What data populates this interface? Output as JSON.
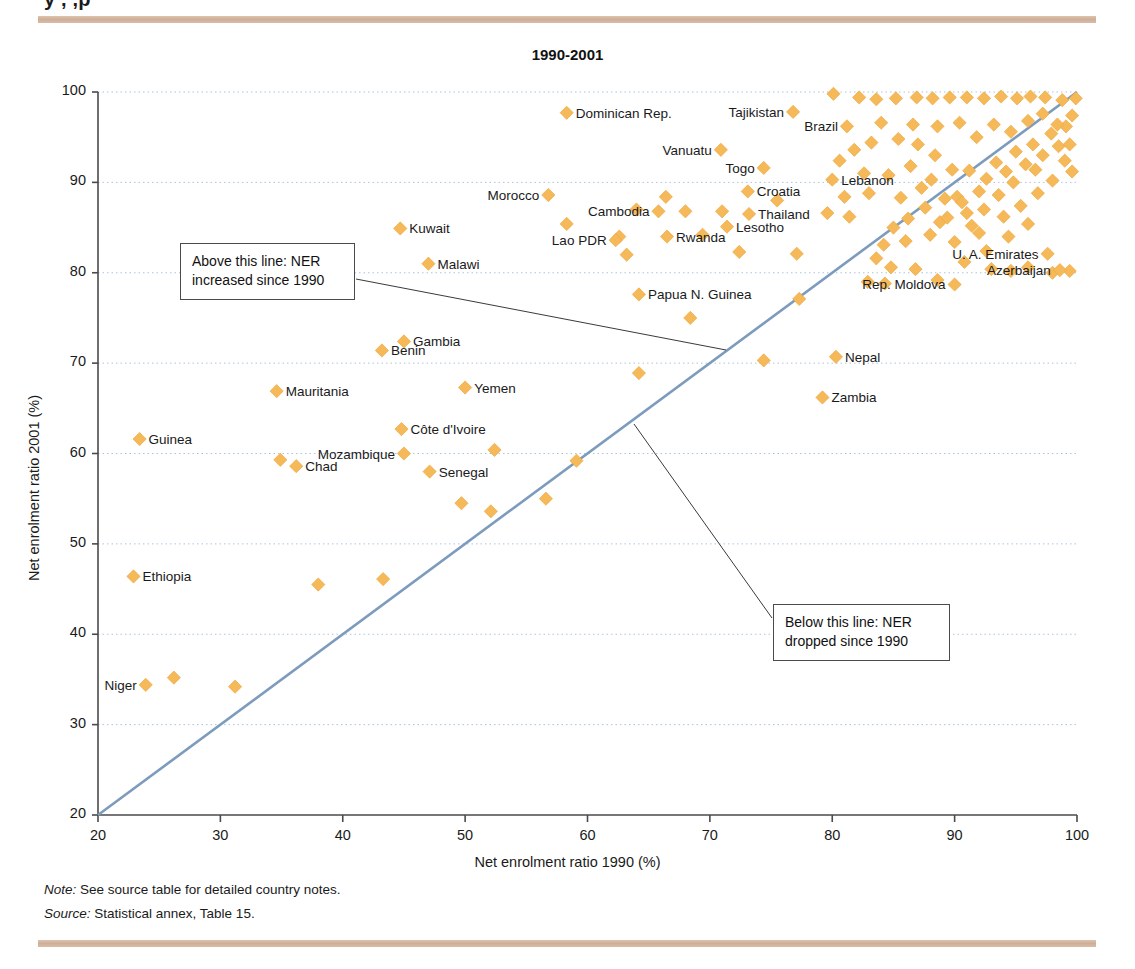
{
  "page": {
    "clipped_heading": "y             ,    ,p",
    "note": {
      "lead": "Note:",
      "text": " See source table for detailed country notes."
    },
    "source": {
      "lead": "Source:",
      "text": " Statistical annex, Table 15."
    },
    "colors": {
      "marker": "#F5B95A",
      "marker_stroke": "#EEA93F",
      "diagonal": "#7C9BBD",
      "grid": "#A9C6E0",
      "axis": "#4a4a4a",
      "rule_bar": "#d3b39c"
    }
  },
  "annotations": [
    {
      "id": "above",
      "line1": "Above this line: NER",
      "line2": "increased since 1990"
    },
    {
      "id": "below",
      "line1": "Below this line: NER",
      "line2": "dropped since 1990"
    }
  ],
  "chart_data": {
    "type": "scatter",
    "title": "1990-2001",
    "xlabel": "Net enrolment ratio 1990 (%)",
    "ylabel": "Net enrolment ratio 2001 (%)",
    "xlim": [
      20,
      100
    ],
    "ylim": [
      20,
      100
    ],
    "xticks": [
      20,
      30,
      40,
      50,
      60,
      70,
      80,
      90,
      100
    ],
    "yticks": [
      20,
      30,
      40,
      50,
      60,
      70,
      80,
      90,
      100
    ],
    "grid": "horizontal-dotted",
    "legend": "none",
    "reference_line": {
      "name": "y = x (no change since 1990)",
      "from": [
        20,
        20
      ],
      "to": [
        100,
        100
      ]
    },
    "labeled_points": [
      {
        "label": "Dominican Rep.",
        "x": 58.3,
        "y": 97.7,
        "side": "right"
      },
      {
        "label": "Tajikistan",
        "x": 76.8,
        "y": 97.8,
        "side": "left"
      },
      {
        "label": "Brazil",
        "x": 81.2,
        "y": 96.2,
        "side": "left"
      },
      {
        "label": "Vanuatu",
        "x": 70.9,
        "y": 93.6,
        "side": "left"
      },
      {
        "label": "Togo",
        "x": 74.4,
        "y": 91.6,
        "side": "left"
      },
      {
        "label": "Lebanon",
        "x": 80.0,
        "y": 90.3,
        "side": "right"
      },
      {
        "label": "Croatia",
        "x": 73.1,
        "y": 89.0,
        "side": "right"
      },
      {
        "label": "Morocco",
        "x": 56.8,
        "y": 88.6,
        "side": "left"
      },
      {
        "label": "Cambodia",
        "x": 65.8,
        "y": 86.8,
        "side": "left"
      },
      {
        "label": "Thailand",
        "x": 73.2,
        "y": 86.5,
        "side": "right"
      },
      {
        "label": "Kuwait",
        "x": 44.7,
        "y": 84.9,
        "side": "right"
      },
      {
        "label": "Lesotho",
        "x": 71.4,
        "y": 85.1,
        "side": "right"
      },
      {
        "label": "Rwanda",
        "x": 66.5,
        "y": 84.0,
        "side": "right"
      },
      {
        "label": "Lao PDR",
        "x": 62.3,
        "y": 83.6,
        "side": "left"
      },
      {
        "label": "Malawi",
        "x": 47.0,
        "y": 81.0,
        "side": "right"
      },
      {
        "label": "U. A. Emirates",
        "x": 97.6,
        "y": 82.1,
        "side": "left"
      },
      {
        "label": "Azerbaijan",
        "x": 98.6,
        "y": 80.3,
        "side": "left"
      },
      {
        "label": "Rep. Moldova",
        "x": 90.0,
        "y": 78.7,
        "side": "left"
      },
      {
        "label": "Papua N. Guinea",
        "x": 64.2,
        "y": 77.6,
        "side": "right"
      },
      {
        "label": "Gambia",
        "x": 45.0,
        "y": 72.4,
        "side": "right"
      },
      {
        "label": "Benin",
        "x": 43.2,
        "y": 71.4,
        "side": "right"
      },
      {
        "label": "Nepal",
        "x": 80.3,
        "y": 70.7,
        "side": "right"
      },
      {
        "label": "Yemen",
        "x": 50.0,
        "y": 67.3,
        "side": "right"
      },
      {
        "label": "Mauritania",
        "x": 34.6,
        "y": 66.9,
        "side": "right"
      },
      {
        "label": "Zambia",
        "x": 79.2,
        "y": 66.2,
        "side": "right"
      },
      {
        "label": "Côte d'Ivoire",
        "x": 44.8,
        "y": 62.7,
        "side": "right"
      },
      {
        "label": "Guinea",
        "x": 23.4,
        "y": 61.6,
        "side": "right"
      },
      {
        "label": "Mozambique",
        "x": 45.0,
        "y": 60.0,
        "side": "left"
      },
      {
        "label": "Chad",
        "x": 36.2,
        "y": 58.6,
        "side": "right"
      },
      {
        "label": "Senegal",
        "x": 47.1,
        "y": 58.0,
        "side": "right"
      },
      {
        "label": "Ethiopia",
        "x": 22.9,
        "y": 46.4,
        "side": "right"
      },
      {
        "label": "Niger",
        "x": 23.9,
        "y": 34.4,
        "side": "left"
      }
    ],
    "unlabeled_points": [
      [
        26.2,
        35.2
      ],
      [
        31.2,
        34.2
      ],
      [
        38.0,
        45.5
      ],
      [
        43.3,
        46.1
      ],
      [
        49.7,
        54.5
      ],
      [
        52.1,
        53.6
      ],
      [
        56.6,
        55.0
      ],
      [
        59.1,
        59.2
      ],
      [
        52.4,
        60.4
      ],
      [
        34.9,
        59.3
      ],
      [
        64.2,
        68.9
      ],
      [
        68.4,
        75.0
      ],
      [
        74.4,
        70.3
      ],
      [
        77.3,
        77.1
      ],
      [
        72.4,
        82.3
      ],
      [
        77.1,
        82.1
      ],
      [
        83.6,
        81.6
      ],
      [
        84.3,
        78.8
      ],
      [
        82.9,
        79.0
      ],
      [
        88.6,
        79.2
      ],
      [
        88.8,
        85.6
      ],
      [
        91.0,
        86.6
      ],
      [
        89.4,
        86.1
      ],
      [
        86.0,
        83.5
      ],
      [
        84.2,
        83.1
      ],
      [
        81.4,
        86.2
      ],
      [
        85.6,
        88.3
      ],
      [
        87.3,
        89.4
      ],
      [
        88.1,
        90.3
      ],
      [
        90.2,
        88.4
      ],
      [
        91.2,
        91.3
      ],
      [
        92.0,
        89.0
      ],
      [
        92.6,
        90.4
      ],
      [
        93.4,
        92.2
      ],
      [
        94.2,
        91.2
      ],
      [
        95.0,
        93.4
      ],
      [
        95.8,
        92.0
      ],
      [
        96.4,
        94.2
      ],
      [
        97.2,
        93.0
      ],
      [
        97.9,
        95.4
      ],
      [
        98.5,
        94.0
      ],
      [
        99.1,
        96.2
      ],
      [
        99.6,
        97.4
      ],
      [
        99.9,
        99.3
      ],
      [
        98.8,
        99.1
      ],
      [
        97.4,
        99.4
      ],
      [
        96.2,
        99.5
      ],
      [
        95.1,
        99.3
      ],
      [
        93.8,
        99.5
      ],
      [
        92.4,
        99.3
      ],
      [
        91.0,
        99.4
      ],
      [
        89.6,
        99.4
      ],
      [
        88.2,
        99.3
      ],
      [
        86.9,
        99.4
      ],
      [
        85.2,
        99.3
      ],
      [
        83.6,
        99.2
      ],
      [
        82.2,
        99.4
      ],
      [
        80.1,
        99.8
      ],
      [
        84.0,
        96.6
      ],
      [
        86.6,
        96.4
      ],
      [
        88.6,
        96.2
      ],
      [
        90.4,
        96.6
      ],
      [
        91.8,
        95.0
      ],
      [
        93.2,
        96.4
      ],
      [
        94.6,
        95.6
      ],
      [
        96.0,
        96.8
      ],
      [
        97.2,
        97.6
      ],
      [
        98.4,
        96.4
      ],
      [
        99.4,
        94.2
      ],
      [
        99.6,
        91.2
      ],
      [
        96.6,
        91.4
      ],
      [
        94.8,
        90.0
      ],
      [
        93.6,
        88.6
      ],
      [
        92.4,
        87.0
      ],
      [
        91.4,
        85.2
      ],
      [
        90.6,
        87.8
      ],
      [
        89.2,
        88.2
      ],
      [
        87.6,
        87.2
      ],
      [
        86.2,
        86.0
      ],
      [
        85.0,
        85.0
      ],
      [
        88.0,
        84.2
      ],
      [
        90.0,
        83.4
      ],
      [
        92.0,
        84.4
      ],
      [
        94.0,
        86.2
      ],
      [
        95.4,
        87.4
      ],
      [
        96.8,
        88.8
      ],
      [
        98.0,
        90.2
      ],
      [
        99.0,
        92.4
      ],
      [
        90.8,
        81.2
      ],
      [
        92.6,
        82.4
      ],
      [
        94.4,
        84.0
      ],
      [
        96.0,
        85.4
      ],
      [
        89.8,
        91.4
      ],
      [
        88.4,
        93.0
      ],
      [
        87.0,
        94.2
      ],
      [
        85.4,
        94.8
      ],
      [
        83.2,
        94.4
      ],
      [
        81.8,
        93.6
      ],
      [
        80.6,
        92.4
      ],
      [
        82.6,
        91.0
      ],
      [
        84.6,
        90.8
      ],
      [
        86.4,
        91.8
      ],
      [
        83.0,
        88.8
      ],
      [
        81.0,
        88.4
      ],
      [
        79.6,
        86.6
      ],
      [
        84.8,
        80.6
      ],
      [
        86.8,
        80.4
      ],
      [
        93.0,
        80.4
      ],
      [
        94.6,
        80.2
      ],
      [
        96.0,
        80.6
      ],
      [
        98.0,
        80.0
      ],
      [
        99.4,
        80.2
      ],
      [
        62.6,
        84.0
      ],
      [
        68.0,
        86.8
      ],
      [
        71.0,
        86.8
      ],
      [
        69.4,
        84.2
      ],
      [
        64.0,
        87.0
      ],
      [
        66.4,
        88.4
      ],
      [
        63.2,
        82.0
      ],
      [
        58.3,
        85.4
      ],
      [
        75.5,
        88.0
      ]
    ]
  }
}
